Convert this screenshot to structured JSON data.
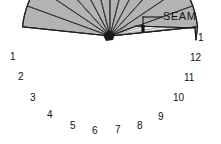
{
  "figure": {
    "kind": "gore-fan-pattern-diagram",
    "background_color": "#ffffff",
    "gore_fill_color": "#b3b3b3",
    "band_fill_color": "#ededed",
    "outline_color": "#1e1e1e",
    "rib_color": "#3a3a3a",
    "hub": {
      "x": 110,
      "y": 36
    },
    "radius": 88,
    "gore_count": 12,
    "fan_start_angle_deg": 186,
    "fan_end_angle_deg": 354,
    "band": {
      "label": "SEAM",
      "tick_x": 143,
      "tick_y": 27,
      "leader_horizontal_y": 17,
      "leader_x_start": 143,
      "leader_x_end": 162,
      "top_left_x": 110,
      "top_left_y": 36,
      "top_peak_x": 136,
      "top_peak_y": 26,
      "top_right_x": 195,
      "top_right_y": 28,
      "right_corner_x": 196,
      "right_corner_y": 40
    },
    "callout": {
      "text": "SEAM",
      "x": 163,
      "y": 11
    },
    "labels": [
      {
        "text": "1",
        "x": 10,
        "y": 52,
        "side": "left"
      },
      {
        "text": "2",
        "x": 18,
        "y": 72,
        "side": "left"
      },
      {
        "text": "3",
        "x": 30,
        "y": 93,
        "side": "left"
      },
      {
        "text": "4",
        "x": 47,
        "y": 110,
        "side": "bottom"
      },
      {
        "text": "5",
        "x": 70,
        "y": 121,
        "side": "bottom"
      },
      {
        "text": "6",
        "x": 92,
        "y": 126,
        "side": "bottom"
      },
      {
        "text": "7",
        "x": 115,
        "y": 125,
        "side": "bottom"
      },
      {
        "text": "8",
        "x": 137,
        "y": 121,
        "side": "bottom"
      },
      {
        "text": "9",
        "x": 158,
        "y": 112,
        "side": "bottom"
      },
      {
        "text": "10",
        "x": 173,
        "y": 93,
        "side": "right"
      },
      {
        "text": "11",
        "x": 184,
        "y": 73,
        "side": "right"
      },
      {
        "text": "12",
        "x": 190,
        "y": 53,
        "side": "right"
      },
      {
        "text": "1",
        "x": 198,
        "y": 33,
        "side": "right"
      }
    ]
  }
}
